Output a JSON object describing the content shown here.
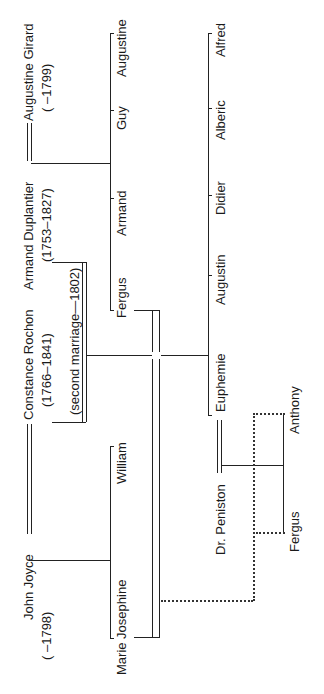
{
  "diagram": {
    "type": "family-tree",
    "orientation": "rotated-90-ccw",
    "generation_1": {
      "couple_a": {
        "husband": {
          "name": "Armand Duplantier",
          "dates": "(1753–1827)"
        },
        "wife": {
          "name": "Augustine Girard",
          "dates": "(      –1799)"
        }
      },
      "couple_b": {
        "husband": {
          "name": "John Joyce",
          "dates": "(      –1798)"
        },
        "wife": {
          "name": "Constance Rochon",
          "dates": "(1766–1841)"
        }
      },
      "second_marriage": {
        "label": "(second marriage—1802)"
      }
    },
    "children_duplantier_girard": [
      "Fergus",
      "Armand",
      "Guy",
      "Augustine"
    ],
    "children_joyce_rochon": [
      "Marie  Josephine",
      "William"
    ],
    "children_duplantier_rochon": [
      "Euphemie",
      "Augustin",
      "Didier",
      "Alberic",
      "Alfred"
    ],
    "generation_3": {
      "couple": {
        "husband": "Dr. Peniston",
        "wife": "Euphemie"
      },
      "children": [
        "Fergus",
        "Anthony"
      ]
    },
    "legend": {
      "double_line": "marriage",
      "single_line": "descent",
      "dotted_line": "namesake / indirect relation"
    }
  }
}
